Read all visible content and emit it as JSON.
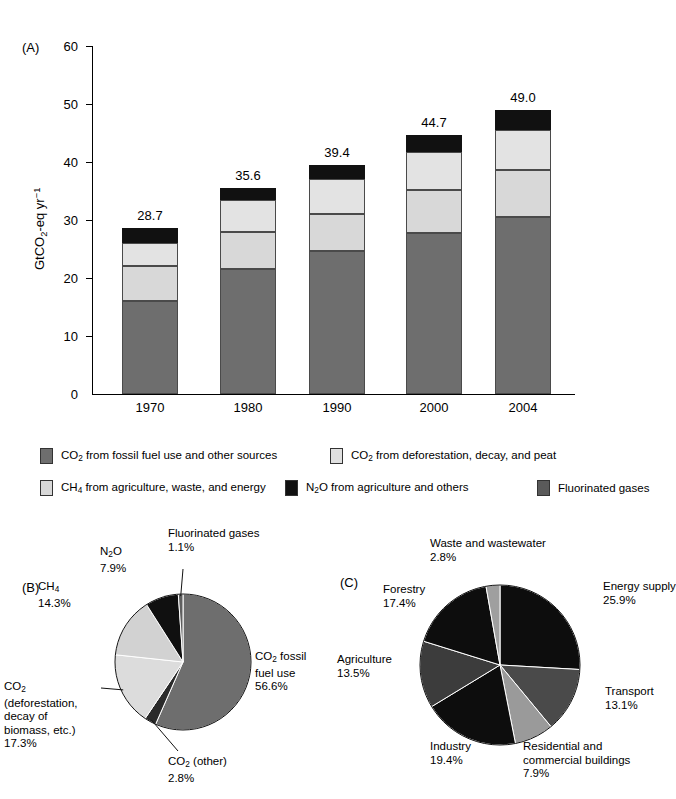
{
  "figure": {
    "panels": [
      {
        "tag": "(A)"
      },
      {
        "tag": "(B)"
      },
      {
        "tag": "(C)"
      }
    ]
  },
  "colors": {
    "co2_fossil": "#6e6e6e",
    "co2_deforestation": "#e0e0e0",
    "ch4": "#d2d2d2",
    "n2o": "#111111",
    "fgas": "#5a5a5a",
    "black": "#0d0d0d",
    "dark_gray": "#444444",
    "mid_gray": "#8a8a8a",
    "light_gray": "#c9c9c9",
    "outline": "#4a4a4a"
  },
  "panelA": {
    "tag": "(A)",
    "ylabel_parts": {
      "pre": "GtCO",
      "sub": "2",
      "mid": "-eq yr",
      "sup": "−1"
    },
    "yticks": [
      0,
      10,
      20,
      30,
      40,
      50,
      60
    ],
    "ylim": [
      0,
      60
    ]
  },
  "legend": {
    "items": [
      {
        "name": "co2-fossil",
        "color": "#6e6e6e",
        "text_pre": "CO",
        "text_sub": "2",
        "text_post": " from fossil fuel use and other sources"
      },
      {
        "name": "co2-deforestation",
        "color": "#e0e0e0",
        "text_pre": "CO",
        "text_sub": "2",
        "text_post": " from deforestation, decay, and peat"
      },
      {
        "name": "ch4",
        "color": "#d8d8d8",
        "text_pre": "CH",
        "text_sub": "4",
        "text_post": " from agriculture, waste, and energy"
      },
      {
        "name": "n2o",
        "color": "#111111",
        "text_pre": "N",
        "text_sub": "2",
        "text_post": "O from agriculture and others"
      },
      {
        "name": "fluorinated-gases",
        "color": "#5a5a5a",
        "text_pre": "Fluorinated gases",
        "text_sub": "",
        "text_post": ""
      }
    ]
  },
  "chart_data": [
    {
      "type": "bar",
      "id": "panel-a-stacked-bar",
      "title": "",
      "xlabel": "",
      "ylabel": "GtCO2-eq yr-1",
      "ylim": [
        0,
        60
      ],
      "yticks": [
        0,
        10,
        20,
        30,
        40,
        50,
        60
      ],
      "grid": false,
      "stacked": true,
      "categories": [
        "1970",
        "1980",
        "1990",
        "2000",
        "2004"
      ],
      "totals": [
        "28.7",
        "35.6",
        "39.4",
        "44.7",
        "49.0"
      ],
      "totals_values": [
        28.7,
        35.6,
        39.4,
        44.7,
        49.0
      ],
      "series": [
        {
          "name": "CO2 from fossil fuel use and other sources",
          "color": "#6e6e6e",
          "values": [
            16.0,
            21.6,
            24.7,
            27.7,
            30.6
          ]
        },
        {
          "name": "CH4 from agriculture, waste, and energy",
          "color": "#d8d8d8",
          "values": [
            6.1,
            6.4,
            6.4,
            7.5,
            8.0
          ]
        },
        {
          "name": "CO2 from deforestation, decay, and peat",
          "color": "#e3e3e3",
          "values": [
            4.0,
            5.5,
            5.9,
            6.6,
            7.0
          ]
        },
        {
          "name": "N2O from agriculture and others",
          "color": "#111111",
          "values": [
            2.6,
            2.1,
            2.4,
            2.9,
            3.4
          ]
        }
      ]
    },
    {
      "type": "pie",
      "id": "panel-b-ghg-by-gas",
      "title": "",
      "start_angle_deg": 0,
      "direction": "clockwise",
      "slices": [
        {
          "label": "CO2 fossil fuel use",
          "label_pre": "CO",
          "label_sub": "2",
          "label_post": " fossil",
          "label_line2": "fuel use",
          "value": 56.6,
          "percent_text": "56.6%",
          "color": "#6e6e6e"
        },
        {
          "label": "CO2 (other)",
          "label_pre": "CO",
          "label_sub": "2",
          "label_post": " (other)",
          "label_line2": "",
          "value": 2.8,
          "percent_text": "2.8%",
          "color": "#2a2a2a"
        },
        {
          "label": "CO2 (deforestation, decay of biomass, etc.)",
          "label_pre": "CO",
          "label_sub": "2",
          "label_post": "",
          "label_line2": "(deforestation,",
          "label_line3": "decay of",
          "label_line4": "biomass, etc.)",
          "value": 17.3,
          "percent_text": "17.3%",
          "color": "#dcdcdc"
        },
        {
          "label": "CH4",
          "label_pre": "CH",
          "label_sub": "4",
          "label_post": "",
          "label_line2": "",
          "value": 14.3,
          "percent_text": "14.3%",
          "color": "#d2d2d2"
        },
        {
          "label": "N2O",
          "label_pre": "N",
          "label_sub": "2",
          "label_post": "O",
          "label_line2": "",
          "value": 7.9,
          "percent_text": "7.9%",
          "color": "#101010"
        },
        {
          "label": "Fluorinated gases",
          "label_pre": "Fluorinated gases",
          "label_sub": "",
          "label_post": "",
          "label_line2": "",
          "value": 1.1,
          "percent_text": "1.1%",
          "color": "#5f5f5f"
        }
      ]
    },
    {
      "type": "pie",
      "id": "panel-c-ghg-by-sector",
      "title": "",
      "start_angle_deg": 0,
      "direction": "clockwise",
      "slices": [
        {
          "label": "Energy supply",
          "value": 25.9,
          "percent_text": "25.9%",
          "color": "#0d0d0d"
        },
        {
          "label": "Transport",
          "value": 13.1,
          "percent_text": "13.1%",
          "color": "#4a4a4a"
        },
        {
          "label": "Residential and commercial buildings",
          "label_line1": "Residential and",
          "label_line2": "commercial buildings",
          "value": 7.9,
          "percent_text": "7.9%",
          "color": "#9a9a9a"
        },
        {
          "label": "Industry",
          "value": 19.4,
          "percent_text": "19.4%",
          "color": "#0d0d0d"
        },
        {
          "label": "Agriculture",
          "value": 13.5,
          "percent_text": "13.5%",
          "color": "#3c3c3c"
        },
        {
          "label": "Forestry",
          "value": 17.4,
          "percent_text": "17.4%",
          "color": "#0d0d0d"
        },
        {
          "label": "Waste and wastewater",
          "value": 2.8,
          "percent_text": "2.8%",
          "color": "#9f9f9f"
        }
      ]
    }
  ]
}
